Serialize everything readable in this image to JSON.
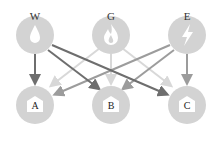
{
  "diagram": {
    "sources": [
      {
        "id": "W",
        "label": "W",
        "icon": "water-drop-icon",
        "x": 35,
        "y": 35,
        "arrow_color": "#6e6e6e"
      },
      {
        "id": "G",
        "label": "G",
        "icon": "gas-flame-icon",
        "x": 111,
        "y": 35,
        "arrow_color": "#d8d8d8"
      },
      {
        "id": "E",
        "label": "E",
        "icon": "lightning-bolt-icon",
        "x": 187,
        "y": 35,
        "arrow_color": "#9c9c9c"
      }
    ],
    "targets": [
      {
        "id": "A",
        "label": "A",
        "icon": "house-icon",
        "x": 35,
        "y": 105
      },
      {
        "id": "B",
        "label": "B",
        "icon": "house-icon",
        "x": 111,
        "y": 105
      },
      {
        "id": "C",
        "label": "C",
        "icon": "house-icon",
        "x": 187,
        "y": 105
      }
    ],
    "edges": [
      [
        "W",
        "A"
      ],
      [
        "W",
        "B"
      ],
      [
        "W",
        "C"
      ],
      [
        "G",
        "A"
      ],
      [
        "G",
        "B"
      ],
      [
        "G",
        "C"
      ],
      [
        "E",
        "A"
      ],
      [
        "E",
        "B"
      ],
      [
        "E",
        "C"
      ]
    ],
    "node_color": "#d3d3d3"
  }
}
